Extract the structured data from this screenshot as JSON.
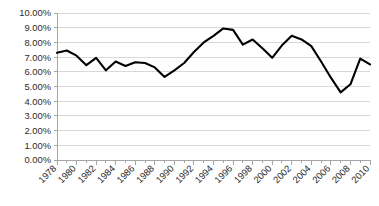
{
  "chart_data": {
    "type": "line",
    "title": "",
    "subtitle": "",
    "xlabel": "",
    "ylabel": "",
    "xlim": [
      1978,
      2010
    ],
    "ylim": [
      0,
      10
    ],
    "ytick_step": 1,
    "grid": true,
    "grid_axis": "y",
    "legend": false,
    "legend_position": "none",
    "x_tick_interval_years": 1,
    "x_label_interval_years": 2,
    "x_label_rotation_deg": 45,
    "value_suffix": "%",
    "y_tick_labels": [
      "0.00%",
      "1.00%",
      "2.00%",
      "3.00%",
      "4.00%",
      "5.00%",
      "6.00%",
      "7.00%",
      "8.00%",
      "9.00%",
      "10.00%"
    ],
    "y_tick_values": [
      0,
      1,
      2,
      3,
      4,
      5,
      6,
      7,
      8,
      9,
      10
    ],
    "x_tick_labels": [
      "1978",
      "1980",
      "1982",
      "1984",
      "1986",
      "1988",
      "1990",
      "1992",
      "1994",
      "1996",
      "1998",
      "2000",
      "2002",
      "2004",
      "2006",
      "2008",
      "2010"
    ],
    "x_tick_label_values": [
      1978,
      1980,
      1982,
      1984,
      1986,
      1988,
      1990,
      1992,
      1994,
      1996,
      1998,
      2000,
      2002,
      2004,
      2006,
      2008,
      2010
    ],
    "x": [
      1978,
      1979,
      1980,
      1981,
      1982,
      1983,
      1984,
      1985,
      1986,
      1987,
      1988,
      1989,
      1990,
      1991,
      1992,
      1993,
      1994,
      1995,
      1996,
      1997,
      1998,
      1999,
      2000,
      2001,
      2002,
      2003,
      2004,
      2005,
      2006,
      2007,
      2008,
      2009,
      2010
    ],
    "series": [
      {
        "name": "Rate",
        "color": "#000000",
        "line_width": 2.1,
        "markers": false,
        "values": [
          7.3,
          7.45,
          7.1,
          6.45,
          6.95,
          6.1,
          6.7,
          6.4,
          6.65,
          6.6,
          6.3,
          5.65,
          6.1,
          6.6,
          7.35,
          8.0,
          8.45,
          8.95,
          8.85,
          7.85,
          8.2,
          7.6,
          6.95,
          7.8,
          8.45,
          8.2,
          7.75,
          6.7,
          5.6,
          4.6,
          5.15,
          6.9,
          6.5
        ]
      }
    ]
  },
  "layout": {
    "plot_left": 57,
    "plot_right": 370,
    "plot_top": 13,
    "plot_bottom": 160,
    "grid_color": "#d9d9d9",
    "axis_color": "#a6a6a6",
    "text_color": "#2b2b2b",
    "background": "#ffffff"
  }
}
